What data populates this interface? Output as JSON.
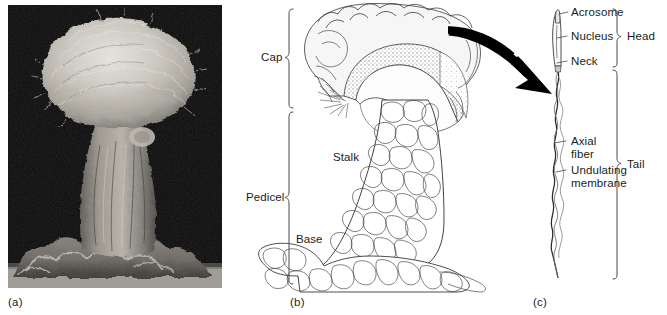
{
  "figure": {
    "background": "#ffffff",
    "ink": "#1b1b1b",
    "arrow_color": "#000000",
    "panels": [
      {
        "id": "a",
        "letter": "(a)",
        "type": "scanning-electron-micrograph"
      },
      {
        "id": "b",
        "letter": "(b)",
        "type": "line-drawing-cross-section"
      },
      {
        "id": "c",
        "letter": "(c)",
        "type": "line-drawing-sperm"
      }
    ]
  },
  "panel_a": {
    "letter": "(a)",
    "caption": "",
    "background_color": "#0a0a0a",
    "subject": "mushroom-shaped specimen micrograph"
  },
  "panel_b": {
    "letter": "(b)",
    "brackets": [
      {
        "label": "Cap",
        "span_top": 8,
        "span_bottom": 108
      },
      {
        "label": "Pedicel",
        "span_top": 110,
        "span_bottom": 284
      }
    ],
    "inline_labels": [
      {
        "label": "Stalk"
      },
      {
        "label": "Base"
      }
    ]
  },
  "panel_c": {
    "letter": "(c)",
    "leader_labels": [
      {
        "label": "Acrosome"
      },
      {
        "label": "Nucleus"
      },
      {
        "label": "Neck"
      },
      {
        "label": "Axial\nfiber"
      },
      {
        "label": "Undulating\nmembrane"
      }
    ],
    "leader_labels_flat": [
      "Acrosome",
      "Nucleus",
      "Neck",
      "Axial",
      "fiber",
      "Undulating",
      "membrane"
    ],
    "brackets": [
      {
        "label": "Head",
        "span_top": 8,
        "span_bottom": 65
      },
      {
        "label": "Tail",
        "span_top": 67,
        "span_bottom": 278
      }
    ]
  }
}
